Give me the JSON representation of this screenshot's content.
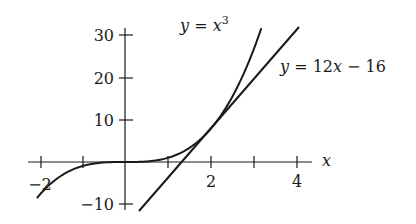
{
  "figure": {
    "curve_label": "y = x³",
    "curve_label_parts": {
      "lhs": "y",
      "eq": " = ",
      "var": "x",
      "exp": "3"
    },
    "tangent_label_parts": {
      "lhs": "y",
      "eq": " = 12",
      "var": "x",
      "rest": " − 16"
    },
    "x_axis_label": "x",
    "x_tick_labels": [
      "−2",
      "2",
      "4"
    ],
    "y_tick_labels": [
      "30",
      "20",
      "10",
      "−10"
    ]
  },
  "colors": {
    "ink": "#1a1a1a",
    "background": "#ffffff"
  },
  "chart_data": {
    "type": "line",
    "title": "",
    "xlabel": "x",
    "ylabel": "",
    "xlim": [
      -2.2,
      4.2
    ],
    "ylim": [
      -12,
      33
    ],
    "x_ticks": [
      -2,
      -1,
      0,
      1,
      2,
      3,
      4
    ],
    "x_tick_labels": [
      "−2",
      "",
      "",
      "",
      "2",
      "",
      "4"
    ],
    "y_ticks": [
      -10,
      10,
      20,
      30
    ],
    "y_tick_labels": [
      "−10",
      "10",
      "20",
      "30"
    ],
    "grid": false,
    "series": [
      {
        "name": "y = x^3",
        "function": "x^3",
        "x_range": [
          -2.05,
          3.17
        ]
      },
      {
        "name": "y = 12x - 16",
        "function": "12x - 16",
        "x_range": [
          0.33,
          4.0
        ]
      }
    ],
    "annotations": [
      {
        "text": "y = x³",
        "near": [
          1.6,
          31
        ]
      },
      {
        "text": "y = 12x − 16",
        "near": [
          3.7,
          22
        ]
      }
    ],
    "tangent_point": [
      2,
      8
    ]
  }
}
